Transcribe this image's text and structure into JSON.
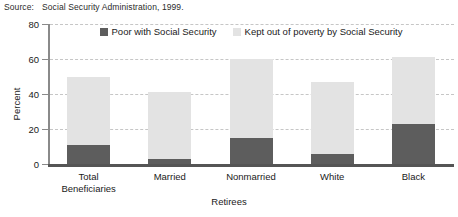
{
  "source": {
    "label": "Source:",
    "text": "Social Security Administration, 1999."
  },
  "colors": {
    "poor_with_ss": "#5d5d5d",
    "kept_out_of_poverty": "#e3e3e3",
    "gridline": "#c6c6c6",
    "axis": "#8a8a8a",
    "baseline": "#555555",
    "text": "#1a1a1a",
    "background": "#ffffff"
  },
  "chart_data": {
    "type": "bar",
    "title": "",
    "subtitle": "",
    "stacked": true,
    "categories": [
      "Total Beneficiaries",
      "Married",
      "Nonmarried",
      "White",
      "Black"
    ],
    "category_lines": [
      [
        "Total",
        "Beneficiaries"
      ],
      [
        "Married"
      ],
      [
        "Nonmarried"
      ],
      [
        "White"
      ],
      [
        "Black"
      ]
    ],
    "series": [
      {
        "name": "Poor with Social Security",
        "color": "#5d5d5d",
        "values": [
          11,
          3,
          15,
          6,
          23
        ]
      },
      {
        "name": "Kept out of poverty by Social Security",
        "color": "#e3e3e3",
        "values": [
          39,
          38,
          45,
          41,
          38
        ]
      }
    ],
    "totals": [
      50,
      41,
      60,
      47,
      61
    ],
    "xlabel": "Retirees",
    "ylabel": "Percent",
    "ylim": [
      0,
      80
    ],
    "yticks": [
      0,
      20,
      40,
      60,
      80
    ],
    "ytick_labels": [
      "0",
      "20",
      "40",
      "60",
      "80"
    ],
    "grid": true,
    "grid_style": "dashed",
    "legend_position": "top-center",
    "legend": [
      "Poor with Social Security",
      "Kept out of poverty by Social Security"
    ]
  }
}
